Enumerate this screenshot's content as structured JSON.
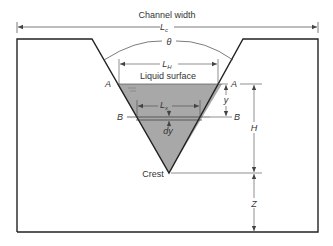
{
  "diagram": {
    "title": "Channel width",
    "channel_width_symbol": "L",
    "channel_width_sub": "c",
    "angle_symbol": "θ",
    "lh_symbol": "L",
    "lh_sub": "H",
    "liquid_surface_label": "Liquid surface",
    "lx_symbol": "L",
    "lx_sub": "x",
    "section_a_left": "A",
    "section_a_right": "A",
    "section_b_left": "B",
    "section_b_right": "B",
    "y_label": "y",
    "dy_label": "dy",
    "h_label": "H",
    "z_label": "Z",
    "crest_label": "Crest"
  },
  "colors": {
    "liquid_fill": "#a8a8a8",
    "outline": "#222222",
    "dimension": "#444444"
  }
}
